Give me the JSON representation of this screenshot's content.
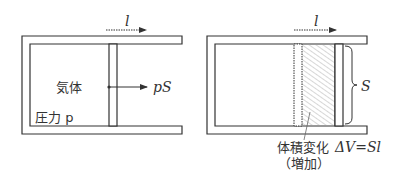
{
  "left_panel": {
    "motion_label": "l",
    "gas_label": "気体",
    "force_label": "pS",
    "pressure_label": "圧力 p"
  },
  "right_panel": {
    "motion_label": "l",
    "area_label": "S",
    "volume_change_label": "体積変化",
    "volume_formula": "ΔV=Sl",
    "increase_label": "（増加）"
  },
  "colors": {
    "line": "#333333",
    "hatch": "#888888",
    "background": "#ffffff"
  }
}
